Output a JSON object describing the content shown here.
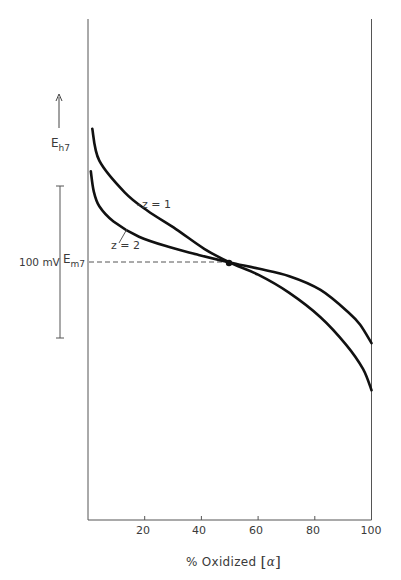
{
  "chart_data": {
    "type": "line",
    "title": "",
    "xlabel": "% Oxidized [α]",
    "xlabel_parts": {
      "text": "% Oxidized",
      "symbol": "α"
    },
    "ylabel": "Eh7",
    "ylabel_parts": {
      "main": "E",
      "sub": "h7"
    },
    "y_direction_arrow": "up",
    "xlim": [
      0,
      100
    ],
    "x_ticks": [
      20,
      40,
      60,
      80,
      100
    ],
    "x_tick_labels": [
      "20",
      "40",
      "60",
      "80",
      "100"
    ],
    "grid": false,
    "legend": "inline labels",
    "reference": {
      "label_main": "E",
      "label_sub": "m7",
      "x": 50,
      "style": "dashed horizontal line to midpoint dot"
    },
    "scale_bar": {
      "label": "100 mV",
      "value_mv": 100
    },
    "units_note": "y values in mV relative to Em7 (0 = midpoint potential), estimated from 100 mV scale bar",
    "series": [
      {
        "name": "z = 1",
        "label": "z = 1",
        "x": [
          1.5,
          4,
          13,
          21,
          31,
          41,
          50,
          60,
          71,
          82,
          91,
          97,
          100
        ],
        "y": [
          88,
          67,
          46,
          34,
          22,
          9,
          0,
          -8,
          -20,
          -36,
          -54,
          -70,
          -84
        ]
      },
      {
        "name": "z = 2",
        "label": "z = 2",
        "x": [
          1,
          2,
          4,
          9,
          18,
          29,
          39,
          50,
          60,
          71,
          82,
          92,
          96,
          100
        ],
        "y": [
          60,
          47,
          37,
          27,
          17,
          10,
          5,
          0,
          -4,
          -9,
          -18,
          -33,
          -41,
          -53
        ]
      }
    ],
    "annotations": [
      {
        "text": "z = 1",
        "points_to": "z = 1 curve"
      },
      {
        "text": "z = 2",
        "points_to": "z = 2 curve"
      },
      {
        "text": "midpoint dot",
        "x": 50,
        "y": 0
      }
    ]
  },
  "labels": {
    "eh_main": "E",
    "eh_sub": "h7",
    "scale": "100 mV",
    "em_main": "E",
    "em_sub": "m7",
    "z1": "z = 1",
    "z2": "z = 2",
    "xtitle_text": "% Oxidized ",
    "xtitle_open": "[",
    "xtitle_symbol": "α",
    "xtitle_close": "]",
    "ticks": [
      "20",
      "40",
      "60",
      "80",
      "100"
    ]
  },
  "colors": {
    "curve": "#111111",
    "axis": "#555555",
    "dashed": "#555555",
    "text": "#3a3a3a"
  }
}
